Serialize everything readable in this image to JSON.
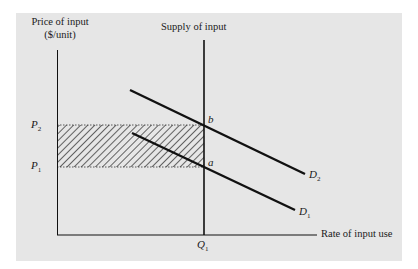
{
  "diagram": {
    "y_axis_label_line1": "Price of input",
    "y_axis_label_line2": "($/unit)",
    "x_axis_label": "Rate of input use",
    "supply_label": "Supply of input",
    "price_labels": {
      "p2": {
        "letter": "P",
        "sub": "2"
      },
      "p1": {
        "letter": "P",
        "sub": "1"
      }
    },
    "quantity_label": {
      "letter": "Q",
      "sub": "1"
    },
    "points": {
      "b": "b",
      "a": "a"
    },
    "demand_labels": {
      "d2": {
        "letter": "D",
        "sub": "2"
      },
      "d1": {
        "letter": "D",
        "sub": "1"
      }
    },
    "colors": {
      "panel_bg": "#e6e6e6",
      "line": "#111111",
      "hatch": "#222222"
    }
  }
}
